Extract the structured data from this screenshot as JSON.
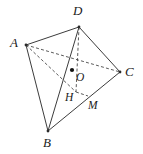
{
  "figure": {
    "kind": "geometry-diagram",
    "canvas": {
      "width": 143,
      "height": 154
    },
    "colors": {
      "background": "#ffffff",
      "solid_edge": "#3c3c3c",
      "dashed_edge": "#4a4a4a",
      "label_text": "#1a1a1a",
      "point_marker": "#111111"
    },
    "vertices": [
      {
        "id": "A",
        "label": "A",
        "x": 26,
        "y": 45,
        "label_x": 10,
        "label_y": 36
      },
      {
        "id": "B",
        "label": "B",
        "x": 48,
        "y": 131,
        "label_x": 43,
        "label_y": 136
      },
      {
        "id": "C",
        "label": "C",
        "x": 120,
        "y": 72,
        "label_x": 125,
        "label_y": 65
      },
      {
        "id": "D",
        "label": "D",
        "x": 79,
        "y": 27,
        "label_x": 73,
        "label_y": 4
      }
    ],
    "points": [
      {
        "id": "O",
        "label": "O",
        "x": 72,
        "y": 70,
        "label_x": 76,
        "label_y": 72,
        "marker": "filled-dot"
      },
      {
        "id": "H",
        "label": "H",
        "x": 76,
        "y": 92,
        "label_x": 65,
        "label_y": 92,
        "marker": "none"
      },
      {
        "id": "M",
        "label": "M",
        "x": 88,
        "y": 96,
        "label_x": 88,
        "label_y": 100,
        "marker": "none"
      }
    ],
    "solid_edges": [
      {
        "from": "A",
        "to": "D"
      },
      {
        "from": "D",
        "to": "C"
      },
      {
        "from": "A",
        "to": "B"
      },
      {
        "from": "B",
        "to": "C"
      },
      {
        "from": "D",
        "to": "B"
      }
    ],
    "dashed_edges": [
      {
        "from": "A",
        "to": "C"
      },
      {
        "from": "D",
        "to": "H"
      },
      {
        "from": "A",
        "to": "H"
      },
      {
        "from": "H",
        "to": "M"
      }
    ]
  }
}
